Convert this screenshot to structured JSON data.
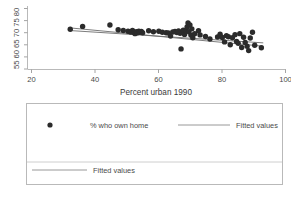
{
  "chart_data": {
    "type": "scatter",
    "title": "",
    "xlabel": "Percent urban 1990",
    "ylabel": "",
    "xlim": [
      20,
      100
    ],
    "ylim": [
      55,
      80
    ],
    "xticks": [
      20,
      40,
      60,
      80,
      100
    ],
    "xticklabels": [
      "20",
      "40",
      "60",
      "80",
      "100"
    ],
    "yticks": [
      55,
      60,
      65,
      70,
      75,
      80
    ],
    "yticklabels": [
      "55",
      "60",
      "65",
      "70",
      "75",
      "80"
    ],
    "ytick_block": "55 60 65 70 75 80",
    "grid": false,
    "legend_position": "below-plot",
    "series": [
      {
        "name": "% who own home",
        "type": "scatter",
        "marker": "filled-circle",
        "color": "#2b2b2b",
        "points": [
          [
            32.2,
            71.4
          ],
          [
            36.1,
            72.6
          ],
          [
            44.7,
            73.2
          ],
          [
            47.3,
            71.2
          ],
          [
            48.9,
            70.9
          ],
          [
            50.4,
            70.6
          ],
          [
            51.2,
            70.3
          ],
          [
            51.8,
            70.9
          ],
          [
            52.2,
            70.1
          ],
          [
            52.6,
            69.6
          ],
          [
            53.0,
            70.4
          ],
          [
            53.4,
            70.0
          ],
          [
            53.8,
            70.6
          ],
          [
            54.1,
            70.2
          ],
          [
            54.6,
            70.5
          ],
          [
            55.0,
            70.0
          ],
          [
            56.9,
            70.8
          ],
          [
            58.4,
            70.4
          ],
          [
            60.1,
            70.6
          ],
          [
            61.2,
            70.2
          ],
          [
            62.4,
            70.0
          ],
          [
            63.1,
            69.9
          ],
          [
            63.8,
            68.6
          ],
          [
            64.5,
            70.3
          ],
          [
            65.2,
            70.5
          ],
          [
            65.8,
            70.1
          ],
          [
            66.3,
            70.7
          ],
          [
            66.8,
            69.8
          ],
          [
            67.1,
            63.3
          ],
          [
            67.4,
            70.2
          ],
          [
            67.8,
            71.0
          ],
          [
            68.2,
            69.3
          ],
          [
            68.6,
            70.9
          ],
          [
            69.0,
            72.4
          ],
          [
            69.3,
            74.0
          ],
          [
            69.6,
            70.4
          ],
          [
            69.9,
            73.2
          ],
          [
            70.2,
            69.0
          ],
          [
            70.5,
            71.6
          ],
          [
            70.8,
            67.9
          ],
          [
            71.4,
            69.6
          ],
          [
            72.6,
            70.8
          ],
          [
            73.1,
            69.1
          ],
          [
            74.8,
            68.4
          ],
          [
            76.2,
            67.4
          ],
          [
            78.6,
            68.2
          ],
          [
            79.4,
            69.4
          ],
          [
            80.1,
            68.0
          ],
          [
            80.8,
            66.2
          ],
          [
            81.4,
            68.8
          ],
          [
            82.0,
            68.3
          ],
          [
            82.6,
            65.0
          ],
          [
            83.3,
            67.9
          ],
          [
            84.1,
            69.2
          ],
          [
            84.6,
            66.4
          ],
          [
            85.1,
            65.6
          ],
          [
            85.6,
            69.6
          ],
          [
            86.2,
            63.9
          ],
          [
            86.8,
            68.1
          ],
          [
            87.3,
            66.0
          ],
          [
            87.9,
            64.4
          ],
          [
            88.4,
            62.6
          ],
          [
            88.9,
            67.8
          ],
          [
            89.6,
            70.2
          ],
          [
            90.3,
            64.8
          ],
          [
            92.4,
            63.8
          ]
        ]
      },
      {
        "name": "Fitted values",
        "type": "line",
        "color": "#6d6d6d",
        "endpoints": [
          [
            32.0,
            72.0
          ],
          [
            93.0,
            64.4
          ]
        ]
      },
      {
        "name": "Fitted values",
        "type": "line",
        "color": "#6d6d6d",
        "endpoints": [
          [
            32.0,
            70.9
          ],
          [
            93.0,
            65.8
          ]
        ]
      }
    ]
  },
  "legend": {
    "rows": [
      {
        "entries": [
          {
            "label": "% who own home",
            "symbol": "filled-circle"
          },
          {
            "label": "Fitted values",
            "symbol": "line"
          }
        ]
      },
      {
        "entries": [
          {
            "label": "Fitted values",
            "symbol": "line"
          }
        ]
      }
    ]
  }
}
